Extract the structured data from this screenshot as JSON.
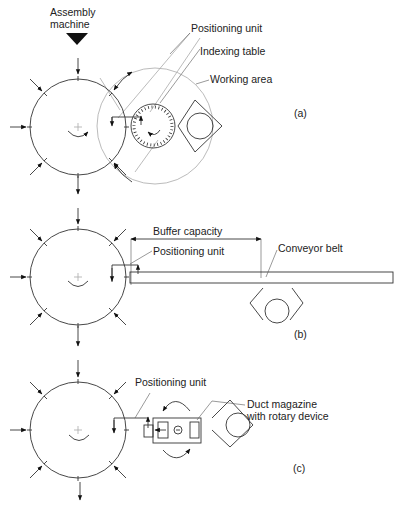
{
  "diagram": {
    "header": {
      "line1": "Assembly",
      "line2": "machine"
    },
    "panel_a": {
      "caption": "(a)",
      "labels": {
        "positioning_unit": "Positioning unit",
        "indexing_table": "Indexing table",
        "working_area": "Working area"
      }
    },
    "panel_b": {
      "caption": "(b)",
      "labels": {
        "buffer_capacity": "Buffer capacity",
        "positioning_unit": "Positioning unit",
        "conveyor_belt": "Conveyor belt"
      }
    },
    "panel_c": {
      "caption": "(c)",
      "labels": {
        "positioning_unit": "Positioning unit",
        "duct_magazine_line1": "Duct magazine",
        "duct_magazine_line2": "with rotary device"
      }
    },
    "colors": {
      "line": "#333333",
      "light_line": "#aaaaaa",
      "background": "#ffffff"
    }
  }
}
